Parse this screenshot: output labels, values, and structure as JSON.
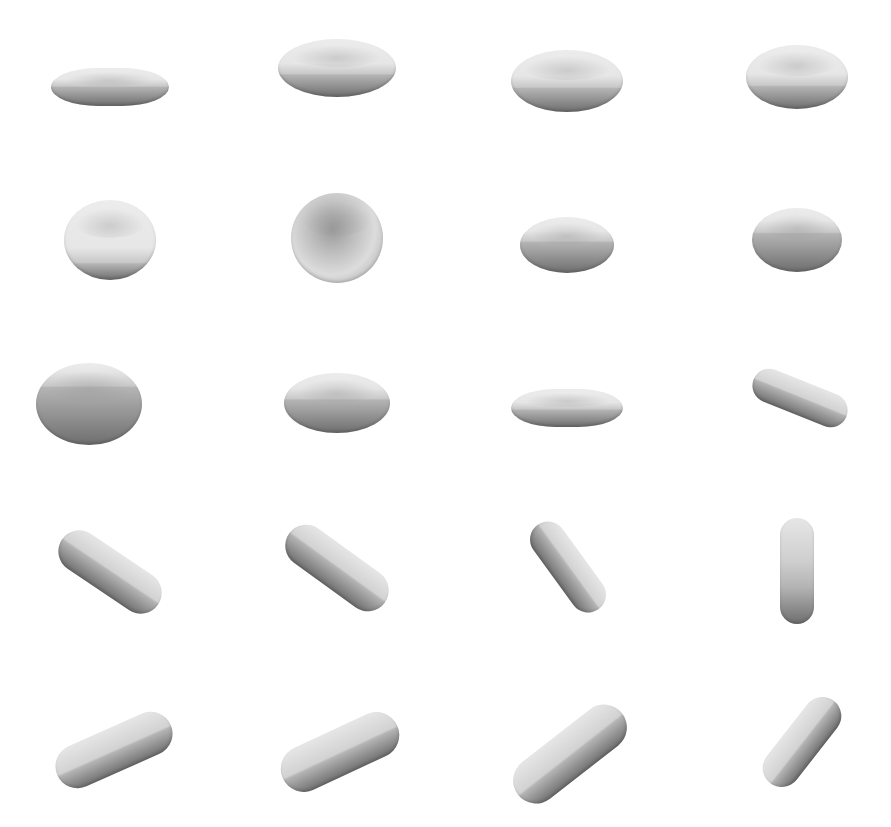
{
  "figure": {
    "layout": {
      "rows": 5,
      "cols": 4
    },
    "colors": {
      "background": "#ffffff",
      "cell_light": "#e6e6e6",
      "cell_mid": "#b4b4b4",
      "cell_dark": "#6e6e6e"
    },
    "cells": [
      {
        "row": 1,
        "col": 1,
        "cx": 110,
        "cy": 87,
        "w": 118,
        "h": 38,
        "rot": 0,
        "shape": "flat",
        "split": 0.5
      },
      {
        "row": 1,
        "col": 2,
        "cx": 337,
        "cy": 68,
        "w": 118,
        "h": 58,
        "rot": 0,
        "shape": "disc",
        "split": 0.62
      },
      {
        "row": 1,
        "col": 3,
        "cx": 567,
        "cy": 81,
        "w": 112,
        "h": 62,
        "rot": 0,
        "shape": "disc",
        "split": 0.62
      },
      {
        "row": 1,
        "col": 4,
        "cx": 797,
        "cy": 77,
        "w": 102,
        "h": 64,
        "rot": 0,
        "shape": "disc",
        "split": 0.65
      },
      {
        "row": 2,
        "col": 1,
        "cx": 110,
        "cy": 240,
        "w": 92,
        "h": 80,
        "rot": 0,
        "shape": "disc",
        "split": 0.8
      },
      {
        "row": 2,
        "col": 2,
        "cx": 337,
        "cy": 238,
        "w": 92,
        "h": 90,
        "rot": 0,
        "shape": "face",
        "split": 1.0
      },
      {
        "row": 2,
        "col": 3,
        "cx": 567,
        "cy": 245,
        "w": 94,
        "h": 56,
        "rot": 0,
        "shape": "disc",
        "split": 0.45
      },
      {
        "row": 2,
        "col": 4,
        "cx": 797,
        "cy": 240,
        "w": 90,
        "h": 64,
        "rot": 0,
        "shape": "disc",
        "split": 0.4
      },
      {
        "row": 3,
        "col": 1,
        "cx": 89,
        "cy": 404,
        "w": 106,
        "h": 82,
        "rot": 0,
        "shape": "disc",
        "split": 0.3
      },
      {
        "row": 3,
        "col": 2,
        "cx": 337,
        "cy": 403,
        "w": 106,
        "h": 60,
        "rot": 0,
        "shape": "disc",
        "split": 0.45
      },
      {
        "row": 3,
        "col": 3,
        "cx": 567,
        "cy": 408,
        "w": 112,
        "h": 38,
        "rot": 0,
        "shape": "flat",
        "split": 0.55
      },
      {
        "row": 3,
        "col": 4,
        "cx": 800,
        "cy": 398,
        "w": 100,
        "h": 34,
        "rot": 22,
        "shape": "pill",
        "split": 0.5
      },
      {
        "row": 4,
        "col": 1,
        "cx": 110,
        "cy": 572,
        "w": 116,
        "h": 42,
        "rot": 34,
        "shape": "pill",
        "split": 0.5
      },
      {
        "row": 4,
        "col": 2,
        "cx": 337,
        "cy": 568,
        "w": 118,
        "h": 42,
        "rot": 36,
        "shape": "pill",
        "split": 0.5
      },
      {
        "row": 4,
        "col": 3,
        "cx": 568,
        "cy": 567,
        "w": 104,
        "h": 36,
        "rot": 54,
        "shape": "pill",
        "split": 0.5
      },
      {
        "row": 4,
        "col": 4,
        "cx": 797,
        "cy": 571,
        "w": 34,
        "h": 106,
        "rot": 0,
        "shape": "pill-v",
        "split": 0.5
      },
      {
        "row": 5,
        "col": 1,
        "cx": 114,
        "cy": 750,
        "w": 124,
        "h": 44,
        "rot": -24,
        "shape": "pill",
        "split": 0.55
      },
      {
        "row": 5,
        "col": 2,
        "cx": 340,
        "cy": 752,
        "w": 126,
        "h": 46,
        "rot": -25,
        "shape": "pill",
        "split": 0.55
      },
      {
        "row": 5,
        "col": 3,
        "cx": 570,
        "cy": 754,
        "w": 132,
        "h": 46,
        "rot": -38,
        "shape": "pill",
        "split": 0.55
      },
      {
        "row": 5,
        "col": 4,
        "cx": 802,
        "cy": 742,
        "w": 104,
        "h": 38,
        "rot": -52,
        "shape": "pill",
        "split": 0.55
      }
    ]
  },
  "caption": {
    "text": "",
    "note": "faint illegible caption strip clipped at bottom edge"
  }
}
